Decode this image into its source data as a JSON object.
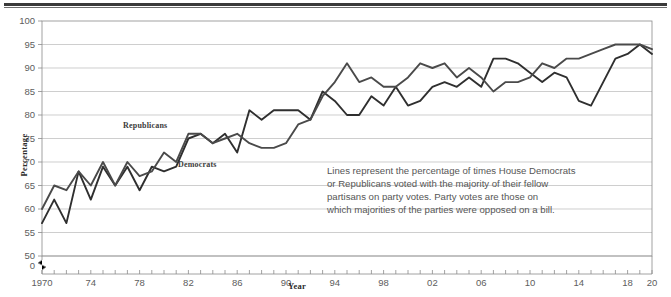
{
  "figure": {
    "ylabel": "Percentage",
    "xlabel": "Year",
    "note": {
      "line1": "Lines represent the percentage of times House Democrats",
      "line2": "or Republicans voted with the majority of their fellow",
      "line3": "partisans on party votes. Party votes are those on",
      "line4": "which majorities of the parties were opposed on a bill."
    },
    "series_labels": {
      "republicans": "Republicans",
      "democrats": "Democrats"
    },
    "colors": {
      "democrats": "#2f2f2f",
      "republicans": "#4a4a4a",
      "grid": "#b9b9b9",
      "frame": "#8a8a8a",
      "text": "#5d5d5d",
      "rule": "#3a3a3a"
    },
    "axis_break_label": "0"
  },
  "chart_data": {
    "type": "line",
    "title": "",
    "xlabel": "Year",
    "ylabel": "Percentage",
    "xlim": [
      1970,
      2020
    ],
    "ylim": [
      50,
      100
    ],
    "y_axis_broken_from_zero": true,
    "grid": true,
    "legend": "inline-labels",
    "ytick_labels": [
      "0",
      "50",
      "55",
      "60",
      "65",
      "70",
      "75",
      "80",
      "85",
      "90",
      "95",
      "100"
    ],
    "ytick_values": [
      50,
      55,
      60,
      65,
      70,
      75,
      80,
      85,
      90,
      95,
      100
    ],
    "xtick_labels": [
      "1970",
      "74",
      "78",
      "82",
      "86",
      "90",
      "94",
      "98",
      "02",
      "06",
      "10",
      "14",
      "18",
      "20"
    ],
    "xtick_values": [
      1970,
      1974,
      1978,
      1982,
      1986,
      1990,
      1994,
      1998,
      2002,
      2006,
      2010,
      2014,
      2018,
      2020
    ],
    "xtick_minor_step": 1,
    "x": [
      1970,
      1971,
      1972,
      1973,
      1974,
      1975,
      1976,
      1977,
      1978,
      1979,
      1980,
      1981,
      1982,
      1983,
      1984,
      1985,
      1986,
      1987,
      1988,
      1989,
      1990,
      1991,
      1992,
      1993,
      1994,
      1995,
      1996,
      1997,
      1998,
      1999,
      2000,
      2001,
      2002,
      2003,
      2004,
      2005,
      2006,
      2007,
      2008,
      2009,
      2010,
      2011,
      2012,
      2013,
      2014,
      2015,
      2016,
      2017,
      2018,
      2019,
      2020
    ],
    "series": [
      {
        "name": "Democrats",
        "values": [
          57,
          62,
          57,
          68,
          62,
          69,
          65,
          69,
          64,
          69,
          68,
          69,
          75,
          76,
          74,
          76,
          72,
          81,
          79,
          81,
          81,
          81,
          79,
          85,
          83,
          80,
          80,
          84,
          82,
          86,
          82,
          83,
          86,
          87,
          86,
          88,
          86,
          92,
          92,
          91,
          89,
          87,
          89,
          88,
          83,
          82,
          87,
          92,
          93,
          95,
          93
        ]
      },
      {
        "name": "Republicans",
        "values": [
          60,
          65,
          64,
          68,
          65,
          70,
          65,
          70,
          67,
          68,
          72,
          70,
          76,
          76,
          74,
          75,
          76,
          74,
          73,
          73,
          74,
          78,
          79,
          84,
          87,
          91,
          87,
          88,
          86,
          86,
          88,
          91,
          90,
          91,
          88,
          90,
          88,
          85,
          87,
          87,
          88,
          91,
          90,
          92,
          92,
          93,
          94,
          95,
          95,
          95,
          94
        ]
      }
    ],
    "annotation": "Lines represent the percentage of times House Democrats or Republicans voted with the majority of their fellow partisans on party votes. Party votes are those on which majorities of the parties were opposed on a bill."
  }
}
